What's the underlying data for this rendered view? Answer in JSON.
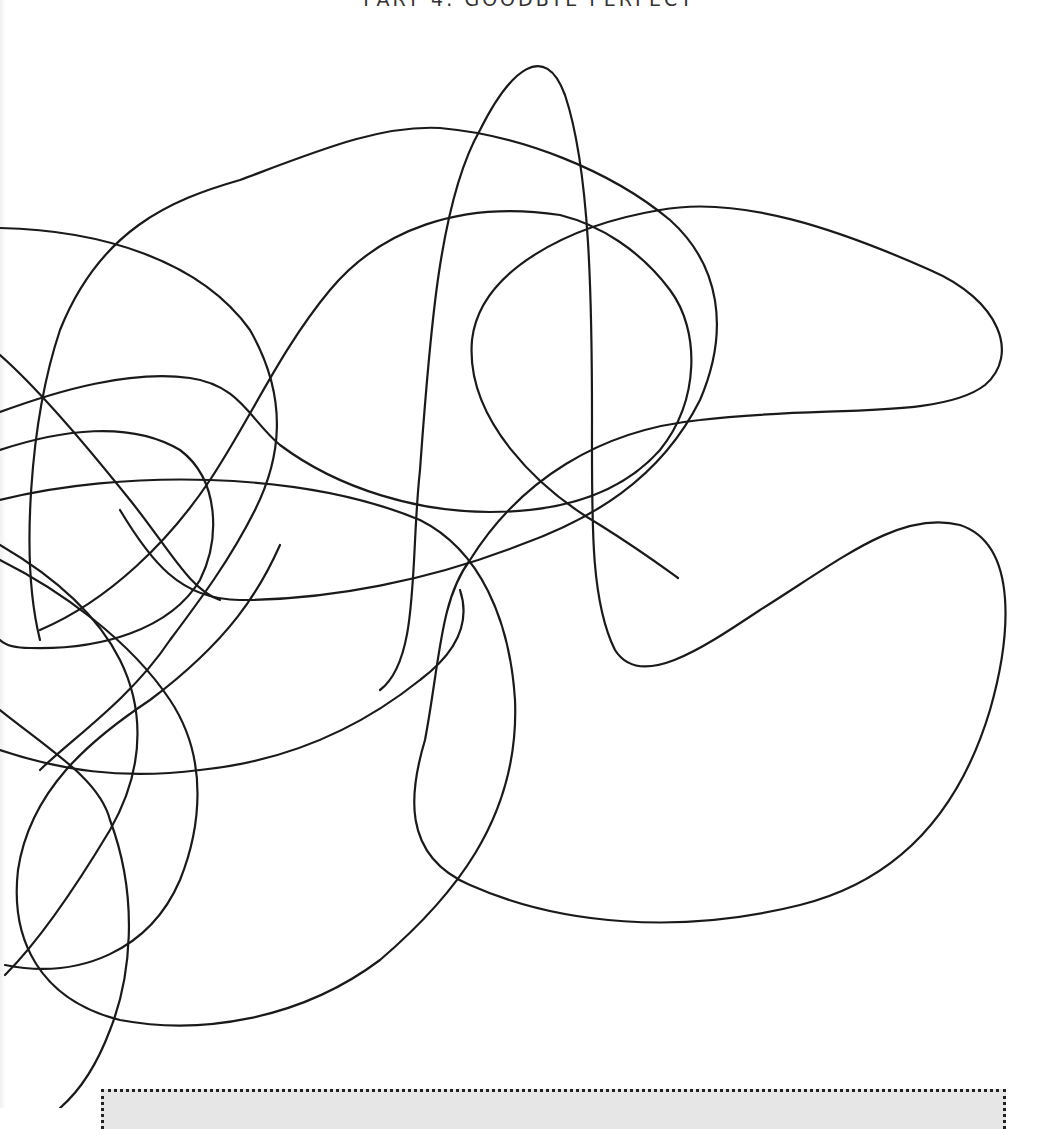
{
  "page": {
    "header": "PART 4: GOODBYE PERFECT",
    "illustration": "continuous-line-scribble",
    "note_box": ""
  },
  "colors": {
    "line": "#1a1a1a",
    "background": "#ffffff",
    "note_fill": "#e6e6e6"
  }
}
